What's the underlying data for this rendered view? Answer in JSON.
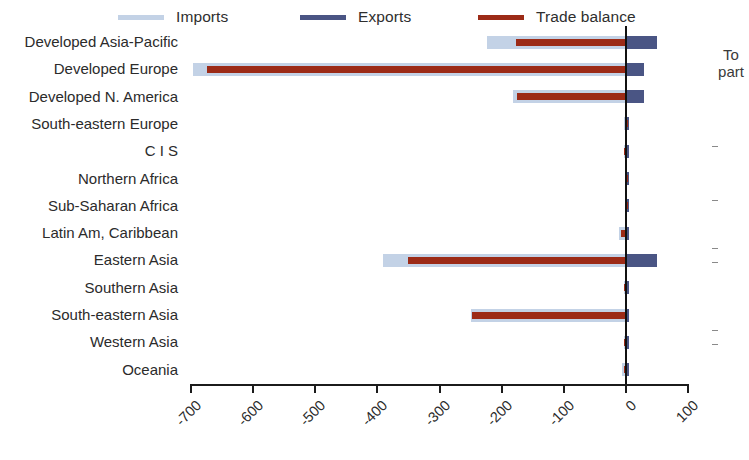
{
  "legend": {
    "items": [
      {
        "label": "Imports",
        "color": "#c3d2e6",
        "name": "legend-imports"
      },
      {
        "label": "Exports",
        "color": "#4a5584",
        "name": "legend-exports"
      },
      {
        "label": "Trade balance",
        "color": "#9c2b17",
        "name": "legend-balance"
      }
    ]
  },
  "side_note": {
    "line1": "To",
    "line2": "part"
  },
  "axis": {
    "tick_labels": [
      "-700",
      "-600",
      "-500",
      "-400",
      "-300",
      "-200",
      "-100",
      "0",
      "100"
    ],
    "tick_values": [
      -700,
      -600,
      -500,
      -400,
      -300,
      -200,
      -100,
      0,
      100
    ]
  },
  "chart_data": {
    "type": "bar",
    "orientation": "horizontal",
    "title": "",
    "xlabel": "",
    "ylabel": "",
    "xlim": [
      -700,
      100
    ],
    "grid": false,
    "legend_position": "top",
    "zero_line": true,
    "categories": [
      "Developed Asia-Pacific",
      "Developed Europe",
      "Developed N. America",
      "South-eastern Europe",
      "C I S",
      "Northern Africa",
      "Sub-Saharan Africa",
      "Latin Am, Caribbean",
      "Eastern Asia",
      "Southern Asia",
      "South-eastern Asia",
      "Western Asia",
      "Oceania"
    ],
    "series": [
      {
        "name": "Imports",
        "color": "#c3d2e6",
        "values": [
          -224,
          -697,
          -182,
          -3,
          -3,
          -2,
          -2,
          -12,
          -391,
          -4,
          -249,
          -3,
          -7
        ]
      },
      {
        "name": "Exports",
        "color": "#4a5584",
        "values": [
          50,
          29,
          29,
          1,
          1,
          1,
          1,
          5,
          50,
          1,
          2,
          1,
          4
        ]
      },
      {
        "name": "Trade balance",
        "color": "#9c2b17",
        "values": [
          -177,
          -675,
          -176,
          -2,
          -3,
          -2,
          -2,
          -8,
          -351,
          -4,
          -248,
          -3,
          -3
        ]
      }
    ]
  }
}
